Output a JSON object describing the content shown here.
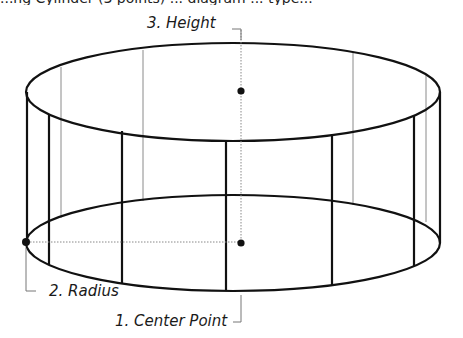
{
  "diagram": {
    "title_cutoff": "...ng Cylinder (3 points) ... diagram ... type...",
    "shape": "cylinder",
    "labels": {
      "height": "3. Height",
      "radius": "2. Radius",
      "center": "1. Center Point"
    },
    "points": [
      {
        "name": "center-point",
        "x": 241,
        "y": 243
      },
      {
        "name": "radius-point",
        "x": 26,
        "y": 242
      },
      {
        "name": "height-point",
        "x": 241,
        "y": 91
      }
    ],
    "colors": {
      "stroke": "#111111",
      "thin_stroke": "#777777",
      "leader": "#888888",
      "background": "#ffffff"
    }
  }
}
